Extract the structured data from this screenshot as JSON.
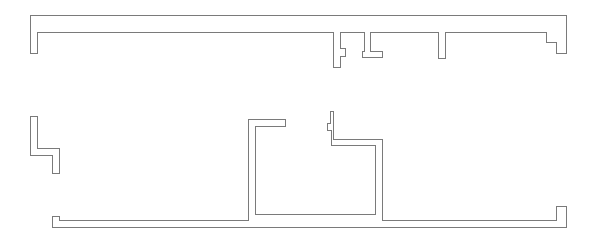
{
  "diagram": {
    "type": "floor-plan-wall-outlines",
    "stroke_color": "#7a7a7a",
    "background": "#ffffff",
    "shapes": [
      {
        "name": "top-wall-section",
        "points": "30,15 566,15 566,53 556,53 556,42 546,42 546,32 445,32 445,58 438,58 438,32 370,32 370,51 382,51 382,57 362,57 362,51 364,51 364,32 340,32 340,48 345,48 345,56 340,56 340,67 333,67 333,32 37,32 37,53 30,53"
      },
      {
        "name": "left-l-wall-section",
        "points": "30,116 37,116 37,148 59,148 59,173 52,173 52,155 30,155"
      },
      {
        "name": "bottom-wall-section",
        "points": "52,216 59,216 59,220 248,220 248,119 285,119 285,126 255,126 255,214 375,214 375,145 331,145 331,130 327,130 327,123 330,123 330,111 333,111 333,139 382,139 382,220 556,220 556,206 566,206 566,227 52,227"
      }
    ]
  }
}
